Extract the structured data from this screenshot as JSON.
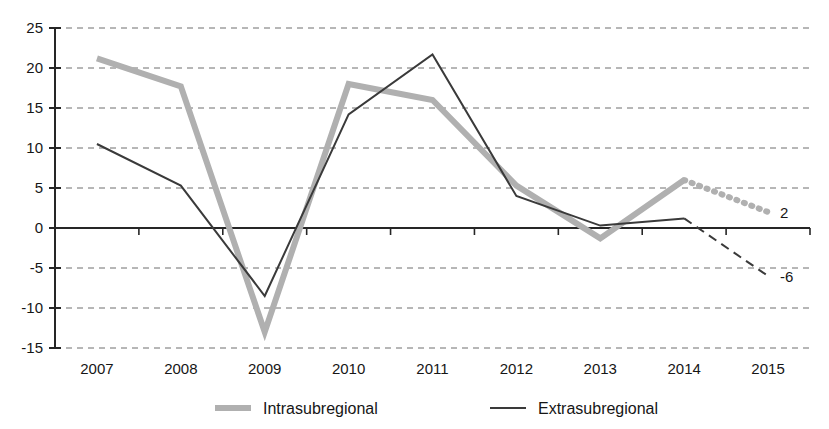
{
  "chart_data": {
    "type": "line",
    "title": "",
    "subtitle": "",
    "xlabel": "",
    "ylabel": "",
    "categories": [
      "2007",
      "2008",
      "2009",
      "2010",
      "2011",
      "2012",
      "2013",
      "2014",
      "2015"
    ],
    "ylim": [
      -15,
      25
    ],
    "yticks": [
      25,
      20,
      15,
      10,
      5,
      0,
      -5,
      -10,
      -15
    ],
    "ytick_labels": [
      "25",
      "20",
      "15",
      "10",
      "5",
      "0",
      "-5",
      "-10",
      "-15"
    ],
    "grid": true,
    "grid_style": "dashed-horizontal",
    "zero_line": true,
    "legend_position": "bottom",
    "series": [
      {
        "name": "Intrasubregional",
        "color": "#b0b0b0",
        "width": 6,
        "style": "solid",
        "values": [
          21.2,
          17.7,
          -13.0,
          18.0,
          16.0,
          5.3,
          -1.3,
          6.0,
          null
        ],
        "forecast": {
          "style": "dotted",
          "from_year": "2014",
          "from_value": 6.0,
          "to_year": "2015",
          "to_value": 2.0,
          "label": "2"
        }
      },
      {
        "name": "Extrasubregional",
        "color": "#3a3a3a",
        "width": 2,
        "style": "solid",
        "values": [
          10.5,
          5.3,
          -8.5,
          14.2,
          21.7,
          4.0,
          0.3,
          1.2,
          null
        ],
        "forecast": {
          "style": "dashed",
          "from_year": "2014",
          "from_value": 1.2,
          "to_year": "2015",
          "to_value": -6.0,
          "label": "-6"
        }
      }
    ],
    "legend": [
      {
        "label": "Intrasubregional",
        "color": "#b0b0b0",
        "width": 6
      },
      {
        "label": "Extrasubregional",
        "color": "#3a3a3a",
        "width": 2
      }
    ],
    "annotations": [
      {
        "text": "2",
        "series": "Intrasubregional",
        "value": 2
      },
      {
        "text": "-6",
        "series": "Extrasubregional",
        "value": -6
      }
    ]
  }
}
